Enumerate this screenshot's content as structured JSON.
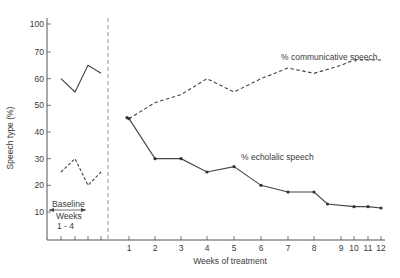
{
  "chart_data": {
    "type": "line",
    "title": "",
    "ylabel": "Speech type (%)",
    "xlabel": "Weeks of treatment",
    "y_ticks": [
      100,
      70,
      60,
      50,
      40,
      30,
      20,
      10
    ],
    "y_axis_note": "broken axis between 70 and 100",
    "ylim": [
      5,
      100
    ],
    "grid": false,
    "legend_position": "inline labels",
    "baseline": {
      "label": "Baseline",
      "weeks_label": "Weeks",
      "range_label": "1 - 4",
      "x": [
        1,
        2,
        3,
        4
      ],
      "series": [
        {
          "name": "% communicative speech",
          "style": "solid",
          "values": [
            60,
            55,
            65,
            62
          ]
        },
        {
          "name": "% echolalic speech",
          "style": "dashed",
          "values": [
            25,
            30,
            20,
            25
          ]
        }
      ]
    },
    "treatment": {
      "x_tick_labels": [
        "1",
        "2",
        "3",
        "4",
        "5",
        "6",
        "7",
        "8",
        "9",
        "10",
        "11",
        "12"
      ],
      "series": [
        {
          "name": "% communicative speech",
          "style": "dashed",
          "x": [
            1,
            2,
            3,
            4,
            5,
            6,
            7,
            8,
            9,
            10,
            12
          ],
          "values": [
            45,
            51,
            54,
            60,
            55,
            60,
            64,
            62,
            65,
            67,
            67
          ]
        },
        {
          "name": "% echolalic speech",
          "style": "solid-with-markers",
          "x": [
            1,
            2,
            3,
            4,
            5,
            6,
            7,
            8,
            8.5,
            10,
            11,
            12
          ],
          "values": [
            45,
            30,
            30,
            25,
            27,
            20,
            17.5,
            17.5,
            13,
            12,
            12,
            11.5
          ]
        }
      ]
    },
    "annotations": [
      {
        "text": "% communicative speech"
      },
      {
        "text": "% echolalic speech"
      },
      {
        "text": "Baseline"
      },
      {
        "text": "Weeks"
      },
      {
        "text": "1 - 4"
      }
    ],
    "colors": {
      "ink": "#3a3a3a",
      "background": "#ffffff"
    }
  }
}
